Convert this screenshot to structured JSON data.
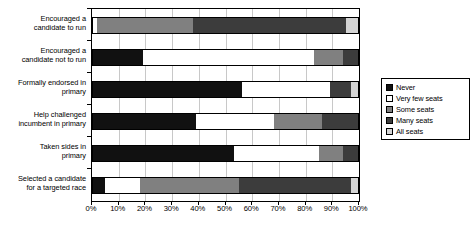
{
  "chart_data": {
    "type": "bar",
    "orientation": "horizontal",
    "stacked": true,
    "stack_mode": "percent",
    "title": "",
    "subtitle": "",
    "xlabel": "",
    "ylabel": "",
    "xlim": [
      0,
      100
    ],
    "xticks": [
      0,
      10,
      20,
      30,
      40,
      50,
      60,
      70,
      80,
      90,
      100
    ],
    "xtick_labels": [
      "0%",
      "10%",
      "20%",
      "30%",
      "40%",
      "50%",
      "60%",
      "70%",
      "80%",
      "90%",
      "100%"
    ],
    "grid": true,
    "legend_position": "right",
    "categories": [
      "Encouraged a candidate to run",
      "Encouraged a candidate not to run",
      "Formally endorsed in primary",
      "Help challenged incumbent in primary",
      "Taken sides in primary",
      "Selected a candidate for a targeted race"
    ],
    "category_lines": [
      [
        "Encouraged a",
        "candidate to run"
      ],
      [
        "Encouraged a",
        "candidate not to run"
      ],
      [
        "Formally endorsed in",
        "primary"
      ],
      [
        "Help challenged",
        "incumbent in primary"
      ],
      [
        "Taken sides in",
        "primary"
      ],
      [
        "Selected a candidate",
        "for a targeted race"
      ]
    ],
    "series": [
      {
        "name": "Never",
        "color": "#111111",
        "values": [
          0,
          19,
          56,
          39,
          53,
          5
        ]
      },
      {
        "name": "Very few seats",
        "color": "#ffffff",
        "values": [
          2,
          64,
          33,
          29,
          32,
          13
        ]
      },
      {
        "name": "Some seats",
        "color": "#808080",
        "values": [
          36,
          11,
          0,
          18,
          9,
          37
        ]
      },
      {
        "name": "Many seats",
        "color": "#3c3c3c",
        "values": [
          57,
          6,
          8,
          14,
          6,
          42
        ]
      },
      {
        "name": "All seats",
        "color": "#d4d4d4",
        "values": [
          5,
          0,
          3,
          0,
          0,
          3
        ]
      }
    ]
  },
  "legend": {
    "items": [
      {
        "label": "Never",
        "color": "#111111"
      },
      {
        "label": "Very few seats",
        "color": "#ffffff"
      },
      {
        "label": "Some seats",
        "color": "#808080"
      },
      {
        "label": "Many seats",
        "color": "#3c3c3c"
      },
      {
        "label": "All seats",
        "color": "#d4d4d4"
      }
    ]
  }
}
